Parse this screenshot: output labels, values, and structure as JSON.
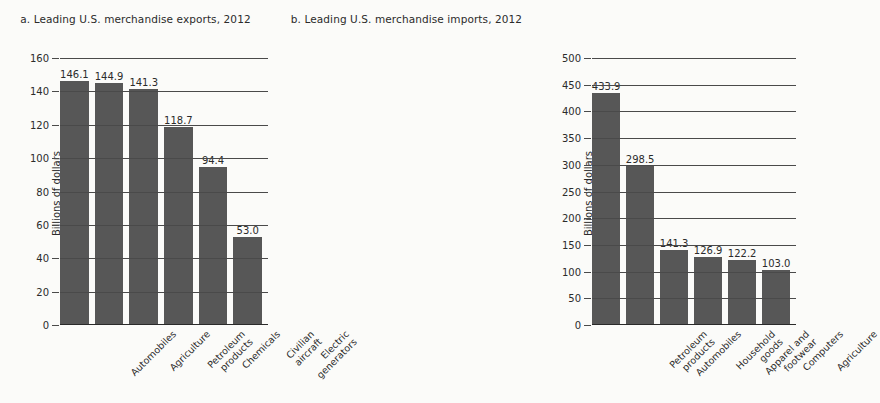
{
  "figure": {
    "background_color": "#fbfbf9",
    "bar_color": "#575757",
    "grid_color": "#4a4a4a"
  },
  "chart_data": [
    {
      "type": "bar",
      "panel": "a",
      "title": "a. Leading U.S. merchandise exports, 2012",
      "xlabel": "",
      "ylabel": "Billions of dollars",
      "ylim": [
        0,
        160
      ],
      "yticks": [
        0,
        20,
        40,
        60,
        80,
        100,
        120,
        140,
        160
      ],
      "grid": true,
      "legend": "none",
      "categories": [
        "Automobiles",
        "Agriculture",
        "Petroleum\nproducts",
        "Chemicals",
        "Civilian\naircraft",
        "Electric\ngenerators"
      ],
      "values": [
        146.1,
        144.9,
        141.3,
        118.7,
        94.4,
        53.0
      ],
      "value_labels": [
        "146.1",
        "144.9",
        "141.3",
        "118.7",
        "94.4",
        "53.0"
      ]
    },
    {
      "type": "bar",
      "panel": "b",
      "title": "b. Leading U.S. merchandise imports, 2012",
      "xlabel": "",
      "ylabel": "Billions of dollars",
      "ylim": [
        0,
        500
      ],
      "yticks": [
        0,
        50,
        100,
        150,
        200,
        250,
        300,
        350,
        400,
        450,
        500
      ],
      "grid": true,
      "legend": "none",
      "categories": [
        "Petroleum\nproducts",
        "Automobiles",
        "Household\ngoods",
        "Apparel and\nfootwear",
        "Computers",
        "Agriculture"
      ],
      "values": [
        433.9,
        298.5,
        141.3,
        126.9,
        122.2,
        103.0
      ],
      "value_labels": [
        "433.9",
        "298.5",
        "141.3",
        "126.9",
        "122.2",
        "103.0"
      ]
    }
  ]
}
